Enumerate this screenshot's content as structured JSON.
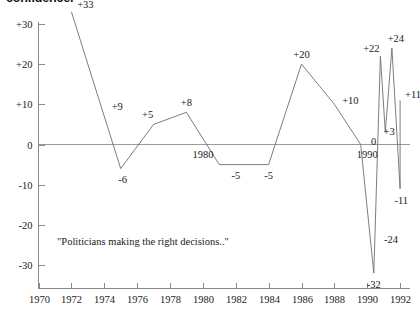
{
  "title_clipped": "confidence.",
  "quote": {
    "text": "\"Politicians making the right decisions..\""
  },
  "inline_years": [
    {
      "label": "1980",
      "x": 1980
    },
    {
      "label": "1990",
      "x": 1990
    }
  ],
  "chart_data": {
    "type": "line",
    "title": "confidence.",
    "xlabel": "",
    "ylabel": "",
    "xlim": [
      1970,
      1992
    ],
    "ylim": [
      -36,
      34
    ],
    "grid": false,
    "legend": null,
    "xticks": [
      1970,
      1972,
      1974,
      1976,
      1978,
      1980,
      1982,
      1984,
      1986,
      1988,
      1990,
      1992
    ],
    "xtick_labels": [
      "1970",
      "1972",
      "1974",
      "1976",
      "1978",
      "1980",
      "1982",
      "1984",
      "1986",
      "1988",
      "1990",
      "1992"
    ],
    "yticks": [
      30,
      20,
      10,
      0,
      -10,
      -20,
      -30
    ],
    "ytick_labels": [
      "+30",
      "+20",
      "+10",
      "0",
      "-10",
      "-20",
      "-30"
    ],
    "x": [
      1972,
      1975,
      1977,
      1979,
      1981,
      1982,
      1984,
      1986,
      1988,
      1989.6,
      1990.4,
      1990.8,
      1991.1,
      1991.5,
      1992
    ],
    "values": [
      33,
      -6,
      5,
      8,
      -5,
      -5,
      -5,
      20,
      10,
      0,
      -32,
      22,
      3,
      24,
      -11
    ],
    "final_x": 1992,
    "final_value": 11,
    "annotations": [
      {
        "text": "+33",
        "x": 1972,
        "y": 33
      },
      {
        "text": "+9",
        "x": 1974,
        "y": 9
      },
      {
        "text": "-6",
        "x": 1975,
        "y": -6
      },
      {
        "text": "+5",
        "x": 1977,
        "y": 5
      },
      {
        "text": "+8",
        "x": 1979,
        "y": 8
      },
      {
        "text": "-5",
        "x": 1982,
        "y": -5
      },
      {
        "text": "-5",
        "x": 1984,
        "y": -5
      },
      {
        "text": "+20",
        "x": 1986,
        "y": 20
      },
      {
        "text": "+10",
        "x": 1988,
        "y": 10
      },
      {
        "text": "0",
        "x": 1989.6,
        "y": 0
      },
      {
        "text": "-32",
        "x": 1990.4,
        "y": -32
      },
      {
        "text": "-24",
        "x": 1990.6,
        "y": -24
      },
      {
        "text": "+22",
        "x": 1990.8,
        "y": 22
      },
      {
        "text": "+3",
        "x": 1991.1,
        "y": 3
      },
      {
        "text": "+24",
        "x": 1991.5,
        "y": 24
      },
      {
        "text": "-11",
        "x": 1991.7,
        "y": -11
      },
      {
        "text": "+11",
        "x": 1992,
        "y": 11
      }
    ],
    "colors": {
      "line": "#6f6f6f",
      "axis": "#8a8a8a",
      "text": "#1a1a1a",
      "background": "#ffffff"
    }
  }
}
